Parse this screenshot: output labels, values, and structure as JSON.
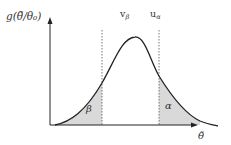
{
  "diagram": {
    "y_axis_label": "g(θ̃/θ₀)",
    "x_axis_label": "θ̃",
    "threshold_labels": {
      "v_beta": "v",
      "v_beta_sub": "β",
      "u_alpha": "u",
      "u_alpha_sub": "α"
    },
    "region_labels": {
      "beta": "β",
      "alpha": "α"
    },
    "colors": {
      "curve": "#222222",
      "shade": "#d9d9d9",
      "axis": "#222222",
      "dashed": "#555555"
    }
  }
}
